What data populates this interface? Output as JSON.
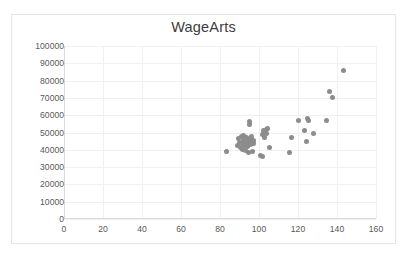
{
  "chart_data": {
    "type": "scatter",
    "title": "WageArts",
    "xlabel": "",
    "ylabel": "",
    "xlim": [
      0,
      160
    ],
    "ylim": [
      0,
      100000
    ],
    "xticks": [
      0,
      20,
      40,
      60,
      80,
      100,
      120,
      140,
      160
    ],
    "yticks": [
      0,
      10000,
      20000,
      30000,
      40000,
      50000,
      60000,
      70000,
      80000,
      90000,
      100000
    ],
    "grid": true,
    "legend": false,
    "marker_color": "#8c8c8c",
    "series": [
      {
        "name": "WageArts",
        "points": [
          [
            83.5,
            39300
          ],
          [
            88.8,
            42700
          ],
          [
            89.5,
            46800
          ],
          [
            90.2,
            44200
          ],
          [
            90.6,
            41300
          ],
          [
            91.0,
            47600
          ],
          [
            91.3,
            43600
          ],
          [
            91.6,
            40200
          ],
          [
            91.9,
            45400
          ],
          [
            92.2,
            48100
          ],
          [
            92.4,
            42400
          ],
          [
            92.7,
            44900
          ],
          [
            92.9,
            39600
          ],
          [
            93.1,
            46200
          ],
          [
            93.4,
            43100
          ],
          [
            93.7,
            47000
          ],
          [
            93.9,
            41800
          ],
          [
            94.1,
            44500
          ],
          [
            94.4,
            38400
          ],
          [
            94.6,
            45900
          ],
          [
            94.8,
            43300
          ],
          [
            95.0,
            56400
          ],
          [
            95.3,
            54800
          ],
          [
            95.5,
            46500
          ],
          [
            95.8,
            42900
          ],
          [
            96.0,
            44000
          ],
          [
            96.3,
            47400
          ],
          [
            96.6,
            38900
          ],
          [
            97.0,
            45200
          ],
          [
            97.4,
            43800
          ],
          [
            101.0,
            36800
          ],
          [
            101.6,
            35900
          ],
          [
            102.0,
            48600
          ],
          [
            102.5,
            50900
          ],
          [
            103.0,
            46900
          ],
          [
            103.6,
            51800
          ],
          [
            104.0,
            49400
          ],
          [
            104.6,
            52100
          ],
          [
            105.2,
            41500
          ],
          [
            115.6,
            38300
          ],
          [
            116.8,
            47100
          ],
          [
            120.2,
            57100
          ],
          [
            123.4,
            51300
          ],
          [
            124.2,
            44900
          ],
          [
            124.8,
            58200
          ],
          [
            125.4,
            56900
          ],
          [
            128.0,
            49600
          ],
          [
            134.8,
            56700
          ],
          [
            136.2,
            73800
          ],
          [
            137.8,
            70400
          ],
          [
            143.4,
            85900
          ]
        ]
      }
    ]
  }
}
